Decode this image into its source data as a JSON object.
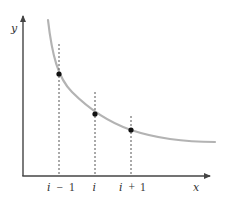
{
  "diagram": {
    "type": "function-curve-with-sample-points",
    "axes": {
      "x_label": "x",
      "y_label": "y",
      "color": "#444444"
    },
    "curve": {
      "description": "decreasing convex curve (e.g. 1/x-like)",
      "color": "#b3b3b3"
    },
    "ticks": [
      {
        "id": "i_minus_1",
        "var": "i",
        "op": "−",
        "num": "1",
        "label": "i − 1"
      },
      {
        "id": "i",
        "var": "i",
        "op": "",
        "num": "",
        "label": "i"
      },
      {
        "id": "i_plus_1",
        "var": "i",
        "op": "+",
        "num": "1",
        "label": "i + 1"
      }
    ],
    "points": [
      {
        "at": "i − 1",
        "color": "#111111"
      },
      {
        "at": "i",
        "color": "#111111"
      },
      {
        "at": "i + 1",
        "color": "#111111"
      }
    ],
    "guide_lines": {
      "style": "dashed",
      "color": "#555555"
    }
  }
}
